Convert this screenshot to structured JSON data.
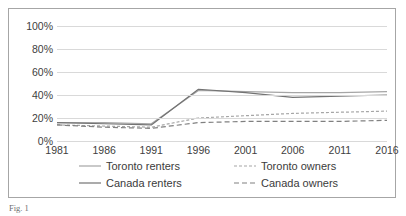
{
  "figure": {
    "caption_prefix": "Fig. 1",
    "caption_text": "Fig. 1"
  },
  "chart_data": {
    "type": "line",
    "title": "",
    "xlabel": "",
    "ylabel": "",
    "categories": [
      "1981",
      "1986",
      "1991",
      "1996",
      "2001",
      "2006",
      "2011",
      "2016"
    ],
    "ylim": [
      0,
      100
    ],
    "yticks": [
      "0%",
      "20%",
      "40%",
      "60%",
      "80%",
      "100%"
    ],
    "ytick_values": [
      0,
      20,
      40,
      60,
      80,
      100
    ],
    "grid": true,
    "legend_position": "bottom",
    "series": [
      {
        "name": "Toronto renters",
        "style": "solid",
        "color": "#a6a6a6",
        "values": [
          16,
          16,
          15,
          44,
          43,
          42,
          42,
          43
        ]
      },
      {
        "name": "Canada renters",
        "style": "solid",
        "color": "#737373",
        "values": [
          16,
          15,
          14,
          45,
          42,
          38,
          39,
          40
        ]
      },
      {
        "name": "Toronto owners",
        "style": "dashed-fine",
        "color": "#a6a6a6",
        "values": [
          14,
          13,
          12,
          20,
          22,
          24,
          25,
          26
        ]
      },
      {
        "name": "Canada owners",
        "style": "dashed-coarse",
        "color": "#808080",
        "values": [
          14,
          12,
          11,
          16,
          17,
          17,
          17,
          18
        ]
      }
    ]
  }
}
